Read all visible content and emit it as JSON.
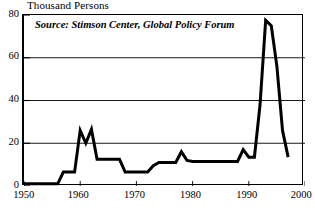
{
  "chart_data": {
    "type": "line",
    "title": "Thousand Persons",
    "xlabel": "",
    "ylabel": "Thousand Persons",
    "annotation": "Source: Stimson Center, Global Policy Forum",
    "grid": true,
    "grid_axis": "y",
    "legend": false,
    "legend_position": "none",
    "xlim": [
      1950,
      2000
    ],
    "ylim": [
      0,
      80
    ],
    "xticks": [
      1950,
      1960,
      1970,
      1980,
      1990,
      2000
    ],
    "xtick_labels": [
      "1950",
      "1960",
      "1970",
      "1980",
      "1990",
      "2000"
    ],
    "yticks": [
      0,
      20,
      40,
      60,
      80
    ],
    "ytick_labels": [
      "0",
      "20",
      "40",
      "60",
      "80"
    ],
    "line_color": "#000000",
    "line_width": 3,
    "series": [
      {
        "name": "UN Peacekeeping Personnel",
        "x": [
          1950,
          1951,
          1952,
          1953,
          1954,
          1955,
          1956,
          1957,
          1958,
          1959,
          1960,
          1961,
          1962,
          1963,
          1964,
          1965,
          1966,
          1967,
          1968,
          1969,
          1970,
          1971,
          1972,
          1973,
          1974,
          1975,
          1976,
          1977,
          1978,
          1979,
          1980,
          1981,
          1982,
          1983,
          1984,
          1985,
          1986,
          1987,
          1988,
          1989,
          1990,
          1991,
          1992,
          1993,
          1994,
          1995,
          1996,
          1997
        ],
        "y": [
          1,
          1,
          1,
          1,
          1,
          1,
          1,
          6.5,
          6.5,
          6.5,
          26,
          20,
          26.5,
          12.5,
          12.5,
          12.5,
          12.5,
          12.5,
          6.5,
          6.5,
          6.5,
          6.5,
          6.5,
          9.5,
          11,
          11,
          11,
          11,
          16,
          12,
          11.5,
          11.5,
          11.5,
          11.5,
          11.5,
          11.5,
          11.5,
          11.5,
          11.5,
          17,
          13.5,
          13.5,
          38,
          77.5,
          75,
          56,
          26,
          13.5
        ]
      }
    ]
  },
  "axis": {
    "ytick_positions_px": [
      185,
      142.25,
      99.5,
      56.75,
      14
    ],
    "xtick_positions_px": [
      22,
      78.2,
      134.4,
      190.6,
      246.8,
      303
    ]
  }
}
